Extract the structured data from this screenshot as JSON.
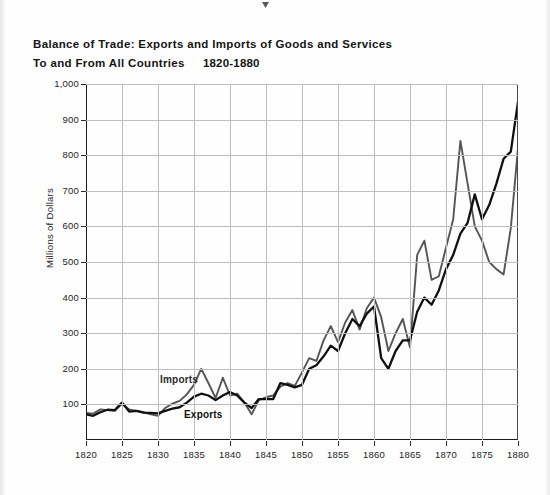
{
  "title": {
    "line1": "Balance of Trade: Exports and Imports of Goods and Services",
    "line2": "To and From All Countries",
    "years": "1820-1880"
  },
  "chart_data": {
    "type": "line",
    "xlabel": "",
    "ylabel": "Millions of Dollars",
    "xlim": [
      1820,
      1880
    ],
    "ylim": [
      0,
      1000
    ],
    "grid": true,
    "legend_position": "inline-annotation",
    "x_ticks": [
      "1820",
      "1825",
      "1830",
      "1835",
      "1840",
      "1845",
      "1850",
      "1855",
      "1860",
      "1865",
      "1870",
      "1875",
      "1880"
    ],
    "y_ticks": [
      "100",
      "200",
      "300",
      "400",
      "500",
      "600",
      "700",
      "800",
      "900",
      "1,000"
    ],
    "annotations": [
      {
        "text": "Imports",
        "x": 1834,
        "y": 175
      },
      {
        "text": "Exports",
        "x": 1836,
        "y": 72
      }
    ],
    "x": [
      1820,
      1821,
      1822,
      1823,
      1824,
      1825,
      1826,
      1827,
      1828,
      1829,
      1830,
      1831,
      1832,
      1833,
      1834,
      1835,
      1836,
      1837,
      1838,
      1839,
      1840,
      1841,
      1842,
      1843,
      1844,
      1845,
      1846,
      1847,
      1848,
      1849,
      1850,
      1851,
      1852,
      1853,
      1854,
      1855,
      1856,
      1857,
      1858,
      1859,
      1860,
      1861,
      1862,
      1863,
      1864,
      1865,
      1866,
      1867,
      1868,
      1869,
      1870,
      1871,
      1872,
      1873,
      1874,
      1875,
      1876,
      1877,
      1878,
      1879,
      1880
    ],
    "series": [
      {
        "name": "Exports",
        "color": "#111111",
        "values": [
          72,
          68,
          78,
          85,
          84,
          105,
          80,
          82,
          77,
          76,
          75,
          82,
          88,
          92,
          105,
          122,
          130,
          125,
          112,
          125,
          135,
          125,
          105,
          90,
          115,
          115,
          115,
          160,
          155,
          148,
          155,
          200,
          210,
          235,
          265,
          250,
          300,
          340,
          320,
          355,
          375,
          230,
          200,
          250,
          280,
          280,
          360,
          400,
          380,
          420,
          480,
          520,
          580,
          610,
          690,
          620,
          660,
          720,
          790,
          810,
          950
        ]
      },
      {
        "name": "Imports",
        "color": "#555555",
        "values": [
          76,
          74,
          86,
          84,
          82,
          102,
          86,
          82,
          78,
          72,
          68,
          90,
          102,
          110,
          128,
          155,
          200,
          160,
          118,
          175,
          125,
          130,
          105,
          72,
          112,
          120,
          125,
          150,
          160,
          152,
          190,
          230,
          222,
          280,
          320,
          275,
          330,
          365,
          310,
          370,
          400,
          345,
          250,
          300,
          340,
          260,
          520,
          560,
          450,
          460,
          540,
          620,
          840,
          720,
          600,
          560,
          500,
          480,
          465,
          595,
          820
        ]
      }
    ]
  },
  "axis": {
    "y_label": "Millions of Dollars"
  },
  "series_labels": {
    "imports": "Imports",
    "exports": "Exports"
  }
}
